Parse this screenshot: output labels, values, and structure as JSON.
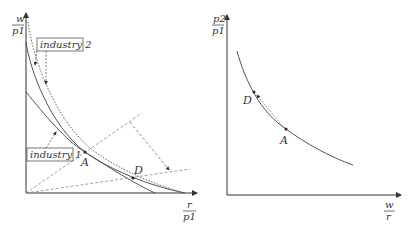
{
  "left_panel": {
    "y_axis_label": {
      "num": "w",
      "den": "p1"
    },
    "x_axis_label": {
      "num": "r",
      "den": "p1"
    },
    "industry2_label": "industry 2",
    "industry1_label": "industry 1",
    "point_A": "A",
    "point_D": "D"
  },
  "right_panel": {
    "y_axis_label": {
      "num": "p2",
      "den": "p1"
    },
    "x_axis_label": {
      "num": "w",
      "den": "r"
    },
    "point_A": "A",
    "point_D": "D"
  },
  "colors": {
    "line": "#555555",
    "dashed": "#777777",
    "background": "#ffffff"
  }
}
